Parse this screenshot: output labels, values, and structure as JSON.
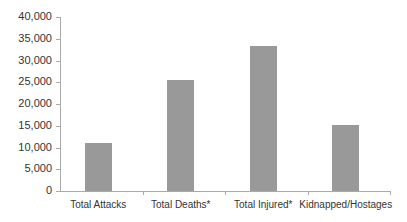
{
  "chart_data": {
    "type": "bar",
    "title": "",
    "xlabel": "",
    "ylabel": "",
    "categories": [
      "Total Attacks",
      "Total Deaths*",
      "Total Injured*",
      "Kidnapped/Hostages"
    ],
    "values": [
      11000,
      25500,
      33300,
      15100
    ],
    "ylim": [
      0,
      40000
    ],
    "yticks": [
      0,
      5000,
      10000,
      15000,
      20000,
      25000,
      30000,
      35000,
      40000
    ],
    "ytick_labels": [
      "0",
      "5,000",
      "10,000",
      "15,000",
      "20,000",
      "25,000",
      "30,000",
      "35,000",
      "40,000"
    ],
    "grid": false,
    "legend": null,
    "bar_color": "#999999"
  }
}
